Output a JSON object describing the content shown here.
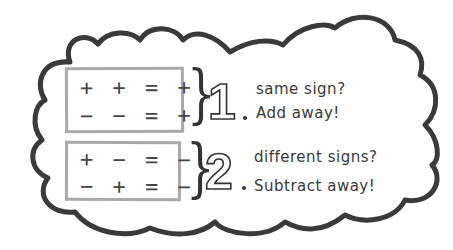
{
  "diagram": {
    "rules": [
      {
        "number": "1",
        "equations": [
          "+ + = +",
          "− − = +"
        ],
        "question": "same sign?",
        "action": "Add away!"
      },
      {
        "number": "2",
        "equations": [
          "+ − = −",
          "− + = −"
        ],
        "question": "different signs?",
        "action": "Subtract away!"
      }
    ],
    "colors": {
      "cloud_outline": "#3a3a3a",
      "box_border": "#a9a9a9",
      "text": "#3a3a3a",
      "background": "#ffffff"
    }
  }
}
